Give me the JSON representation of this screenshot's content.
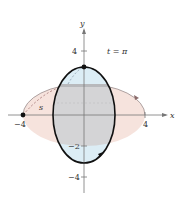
{
  "figure": {
    "parameter_label": "t = π",
    "arc_label": "s",
    "axes": {
      "x_label": "x",
      "y_label": "y",
      "x_ticks": [
        {
          "value": -4,
          "label": "−4"
        },
        {
          "value": 4,
          "label": "4"
        }
      ],
      "y_ticks": [
        {
          "value": 4,
          "label": "4"
        },
        {
          "value": -2,
          "label": "−2"
        },
        {
          "value": -4,
          "label": "−4"
        }
      ]
    },
    "curves": [
      {
        "name": "vertical-ellipse",
        "semi_x": 2,
        "semi_y": 3.14159,
        "stroke": "#111111"
      },
      {
        "name": "horizontal-ellipse",
        "semi_x": 4,
        "semi_y": 2,
        "fill": "#f6e3dd"
      }
    ],
    "points": [
      {
        "name": "point-on-x-axis",
        "x": -4,
        "y": 0
      },
      {
        "name": "point-on-y-axis",
        "x": 0,
        "y": 3.14159
      }
    ],
    "colors": {
      "pink": "#f6e3dd",
      "blue": "#dcedf5",
      "gray": "#d4d4d6",
      "axis": "#777777"
    }
  }
}
